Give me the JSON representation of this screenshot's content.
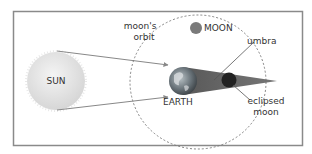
{
  "diagram": {
    "labels": {
      "sun": "SUN",
      "earth": "EARTH",
      "moon": "MOON",
      "orbit_line1": "moon's",
      "orbit_line2": "orbit",
      "umbra": "umbra",
      "eclipsed_line1": "eclipsed",
      "eclipsed_line2": "moon"
    },
    "colors": {
      "border": "#8a8a8a",
      "sun_fill": "#e6e6e6",
      "earth_fill": "#6f7a80",
      "umbra_fill": "#5a5a5a",
      "moon_fill": "#7a7a7a",
      "eclipsed_moon_fill": "#2a2a2a",
      "orbit_stroke": "#777777",
      "ray_stroke": "#888888"
    }
  }
}
